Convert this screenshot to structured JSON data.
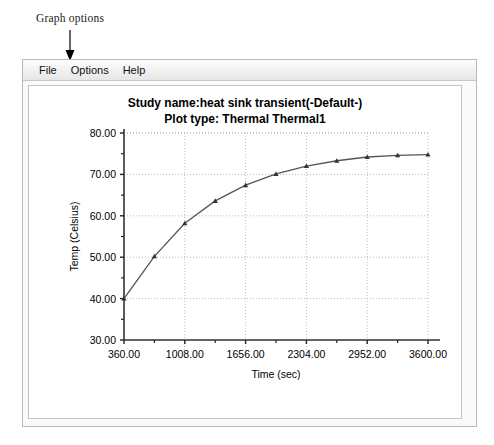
{
  "annotation": {
    "label": "Graph options",
    "arrow_icon": "down-arrow-icon"
  },
  "window": {
    "menu": [
      {
        "name": "file",
        "label": "File"
      },
      {
        "name": "options",
        "label": "Options"
      },
      {
        "name": "help",
        "label": "Help"
      }
    ]
  },
  "chart_data": {
    "type": "line",
    "title": "Study name:heat sink transient(-Default-)",
    "subtitle": "Plot type: Thermal Thermal1",
    "title_lines": [
      "Study name:heat sink transient(-Default-)",
      "Plot type: Thermal Thermal1"
    ],
    "xlabel": "Time (sec)",
    "ylabel": "Temp (Celsius)",
    "xlim": [
      360,
      3600
    ],
    "ylim": [
      30,
      80
    ],
    "xticks": [
      360,
      1008,
      1656,
      2304,
      2952,
      3600
    ],
    "xtick_labels": [
      "360.00",
      "1008.00",
      "1656.00",
      "2304.00",
      "2952.00",
      "3600.00"
    ],
    "yticks": [
      30,
      40,
      50,
      60,
      70,
      80
    ],
    "ytick_labels": [
      "30.00",
      "40.00",
      "50.00",
      "60.00",
      "70.00",
      "80.00"
    ],
    "x_minor_ticks": [
      684,
      1332,
      1980,
      2628,
      3276
    ],
    "y_minor_ticks": [
      35,
      45,
      55,
      65,
      75
    ],
    "grid": true,
    "grid_style": "dotted",
    "grid_color": "#aaaaaa",
    "legend": null,
    "line_color": "#555555",
    "marker": "triangle",
    "marker_color": "#333333",
    "series": [
      {
        "name": "Thermal1",
        "x": [
          360,
          684,
          1008,
          1332,
          1656,
          1980,
          2304,
          2628,
          2952,
          3276,
          3600
        ],
        "values": [
          40.0,
          50.2,
          58.2,
          63.6,
          67.4,
          70.1,
          72.0,
          73.3,
          74.2,
          74.6,
          74.8
        ]
      }
    ]
  }
}
